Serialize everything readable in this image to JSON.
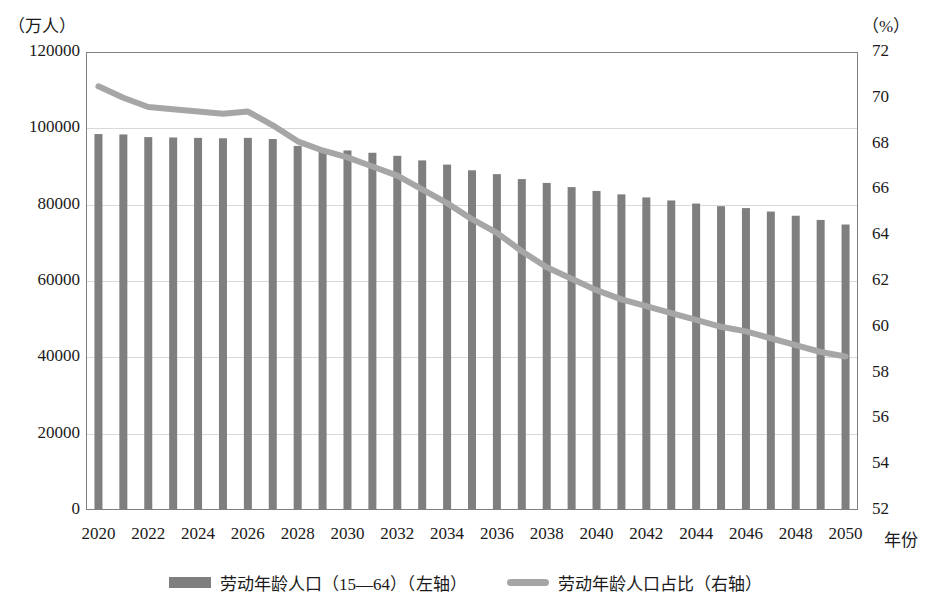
{
  "axes": {
    "left_unit": "（万人）",
    "right_unit": "（%）",
    "x_title": "年份",
    "left_ticks": [
      "0",
      "20000",
      "40000",
      "60000",
      "80000",
      "100000",
      "120000"
    ],
    "right_ticks": [
      "52",
      "54",
      "56",
      "58",
      "60",
      "62",
      "64",
      "66",
      "68",
      "70",
      "72"
    ]
  },
  "legend": {
    "bar_label": "劳动年龄人口（15—64）（左轴）",
    "line_label": "劳动年龄人口占比（右轴）"
  },
  "colors": {
    "bar": "#7f7f7f",
    "line": "#a6a6a6",
    "grid": "#d9d9d9",
    "text": "#1a1a1a"
  },
  "chart_data": {
    "type": "bar",
    "title": "",
    "xlabel": "年份",
    "ylabel": "（万人）",
    "y2label": "（%）",
    "grid": true,
    "legend_position": "bottom",
    "ylim": [
      0,
      120000
    ],
    "y2lim": [
      52,
      72
    ],
    "ytick_step": 20000,
    "y2tick_step": 2,
    "xtick_labels": [
      "2020",
      "2022",
      "2024",
      "2026",
      "2028",
      "2030",
      "2032",
      "2034",
      "2036",
      "2038",
      "2040",
      "2042",
      "2044",
      "2046",
      "2048",
      "2050"
    ],
    "categories": [
      2020,
      2021,
      2022,
      2023,
      2024,
      2025,
      2026,
      2027,
      2028,
      2029,
      2030,
      2031,
      2032,
      2033,
      2034,
      2035,
      2036,
      2037,
      2038,
      2039,
      2040,
      2041,
      2042,
      2043,
      2044,
      2045,
      2046,
      2047,
      2048,
      2049,
      2050
    ],
    "series": [
      {
        "name": "劳动年龄人口（15—64）（左轴）",
        "axis": "left",
        "type": "bar",
        "unit": "万人",
        "color": "#7f7f7f",
        "values": [
          98500,
          98400,
          97700,
          97600,
          97500,
          97400,
          97500,
          97200,
          95400,
          94600,
          94200,
          93600,
          92800,
          91600,
          90500,
          89000,
          88000,
          86700,
          85700,
          84600,
          83600,
          82700,
          81900,
          81100,
          80300,
          79600,
          79100,
          78200,
          77100,
          76000,
          74800
        ]
      },
      {
        "name": "劳动年龄人口占比（右轴）",
        "axis": "right",
        "type": "line",
        "unit": "%",
        "color": "#a6a6a6",
        "values": [
          70.5,
          70.0,
          69.6,
          69.5,
          69.4,
          69.3,
          69.4,
          68.8,
          68.1,
          67.7,
          67.4,
          67.0,
          66.6,
          66.0,
          65.4,
          64.7,
          64.1,
          63.3,
          62.6,
          62.1,
          61.6,
          61.2,
          60.9,
          60.6,
          60.3,
          60.0,
          59.8,
          59.5,
          59.2,
          58.9,
          58.7
        ]
      }
    ]
  }
}
